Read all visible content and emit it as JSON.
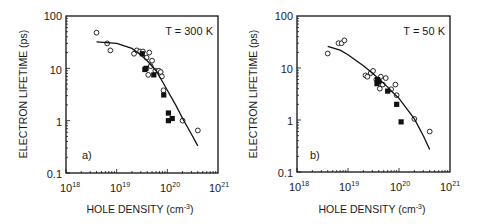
{
  "chart_data": [
    {
      "type": "scatter",
      "panel_label": "a)",
      "annotation": "T = 300 K",
      "xlabel": "HOLE DENSITY (cm-3)",
      "ylabel": "ELECTRON LIFETIME (ps)",
      "xscale": "log",
      "yscale": "log",
      "xlim": [
        1e+18,
        1e+21
      ],
      "ylim": [
        0.1,
        100
      ],
      "x_tick_labels": [
        "10^18",
        "10^19",
        "10^20",
        "10^21"
      ],
      "y_tick_labels": [
        "0.1",
        "1",
        "10",
        "100"
      ],
      "grid": false,
      "series": [
        {
          "name": "open circles",
          "marker": "open-circle",
          "points": [
            [
              4e+18,
              48
            ],
            [
              6.5e+18,
              30
            ],
            [
              7.5e+18,
              22
            ],
            [
              2.2e+19,
              19
            ],
            [
              2.5e+19,
              22
            ],
            [
              2.9e+19,
              21
            ],
            [
              3.3e+19,
              21
            ],
            [
              3.9e+19,
              16
            ],
            [
              4.4e+19,
              20
            ],
            [
              5e+19,
              14
            ],
            [
              4.7e+19,
              11
            ],
            [
              4.2e+19,
              7.5
            ],
            [
              5.8e+19,
              9
            ],
            [
              6.8e+19,
              9
            ],
            [
              7.4e+19,
              8.5
            ],
            [
              7.8e+19,
              7
            ],
            [
              8.4e+19,
              3.8
            ],
            [
              2e+20,
              1.0
            ],
            [
              4e+20,
              0.65
            ]
          ]
        },
        {
          "name": "filled squares",
          "marker": "filled-square",
          "points": [
            [
              3.2e+19,
              19
            ],
            [
              3.8e+19,
              10
            ],
            [
              3.6e+19,
              9.5
            ],
            [
              5.4e+19,
              7.5
            ],
            [
              8.5e+19,
              3.1
            ],
            [
              1.05e+20,
              1.4
            ],
            [
              1.05e+20,
              1.0
            ],
            [
              1.25e+20,
              1.1
            ]
          ]
        },
        {
          "name": "fit curve",
          "marker": "line",
          "points": [
            [
              4e+18,
              32
            ],
            [
              1e+19,
              30
            ],
            [
              2e+19,
              24
            ],
            [
              3e+19,
              18
            ],
            [
              4e+19,
              14
            ],
            [
              6e+19,
              9
            ],
            [
              8e+19,
              5.6
            ],
            [
              1e+20,
              3.8
            ],
            [
              1.5e+20,
              1.9
            ],
            [
              2e+20,
              1.1
            ],
            [
              3e+20,
              0.55
            ],
            [
              4e+20,
              0.33
            ]
          ]
        }
      ]
    },
    {
      "type": "scatter",
      "panel_label": "b)",
      "annotation": "T = 50 K",
      "xlabel": "HOLE DENSITY (cm-3)",
      "ylabel": "ELECTRON LIFETIME (ps)",
      "xscale": "log",
      "yscale": "log",
      "xlim": [
        1e+18,
        1e+21
      ],
      "ylim": [
        0.1,
        100
      ],
      "x_tick_labels": [
        "10^18",
        "10^19",
        "10^20",
        "10^21"
      ],
      "y_tick_labels": [
        "0.1",
        "1",
        "10",
        "100"
      ],
      "grid": false,
      "series": [
        {
          "name": "open circles",
          "marker": "open-circle",
          "points": [
            [
              4e+18,
              19
            ],
            [
              6.5e+18,
              30
            ],
            [
              7.5e+18,
              30
            ],
            [
              8.5e+18,
              34
            ],
            [
              2.2e+19,
              7.2
            ],
            [
              2.4e+19,
              6.8
            ],
            [
              2.8e+19,
              8
            ],
            [
              3.1e+19,
              8.8
            ],
            [
              3.6e+19,
              6
            ],
            [
              4e+19,
              5.5
            ],
            [
              4.4e+19,
              6.8
            ],
            [
              4.2e+19,
              4.0
            ],
            [
              4.8e+19,
              4.8
            ],
            [
              5.5e+19,
              6.4
            ],
            [
              7e+19,
              3.9
            ],
            [
              8.5e+19,
              4.8
            ],
            [
              9e+19,
              3.0
            ],
            [
              2e+20,
              1.05
            ],
            [
              4e+20,
              0.6
            ]
          ]
        },
        {
          "name": "filled squares",
          "marker": "filled-square",
          "points": [
            [
              3.8e+19,
              6
            ],
            [
              3.7e+19,
              5.0
            ],
            [
              4e+19,
              5.5
            ],
            [
              6e+19,
              3.6
            ],
            [
              9e+19,
              2.0
            ],
            [
              1.1e+20,
              0.92
            ]
          ]
        },
        {
          "name": "fit curve",
          "marker": "line",
          "points": [
            [
              4e+18,
              26
            ],
            [
              7e+18,
              22
            ],
            [
              1e+19,
              18
            ],
            [
              2e+19,
              11
            ],
            [
              3e+19,
              8
            ],
            [
              4e+19,
              6.2
            ],
            [
              6e+19,
              4.3
            ],
            [
              8e+19,
              3.2
            ],
            [
              1e+20,
              2.6
            ],
            [
              2e+20,
              1.05
            ],
            [
              3e+20,
              0.5
            ],
            [
              4e+20,
              0.27
            ]
          ]
        }
      ]
    }
  ],
  "panels": [
    {
      "annotation": "T = 300 K",
      "panel_label": "a)",
      "ylabel": "ELECTRON LIFETIME (ps)",
      "xlabel_main": "HOLE DENSITY (cm",
      "xlabel_sup": "-3",
      "xlabel_close": ")",
      "y_ticks": [
        "100",
        "10",
        "1",
        "0.1"
      ],
      "x_ticks_base": [
        "10",
        "10",
        "10",
        "10"
      ],
      "x_ticks_exp": [
        "18",
        "19",
        "20",
        "21"
      ]
    },
    {
      "annotation": "T = 50 K",
      "panel_label": "b)",
      "ylabel": "ELECTRON LIFETIME (ps)",
      "xlabel_main": "HOLE DENSITY (cm",
      "xlabel_sup": "-3",
      "xlabel_close": ")",
      "y_ticks": [
        "100",
        "10",
        "1",
        "0.1"
      ],
      "x_ticks_base": [
        "10",
        "10",
        "10",
        "10"
      ],
      "x_ticks_exp": [
        "18",
        "19",
        "20",
        "21"
      ]
    }
  ]
}
